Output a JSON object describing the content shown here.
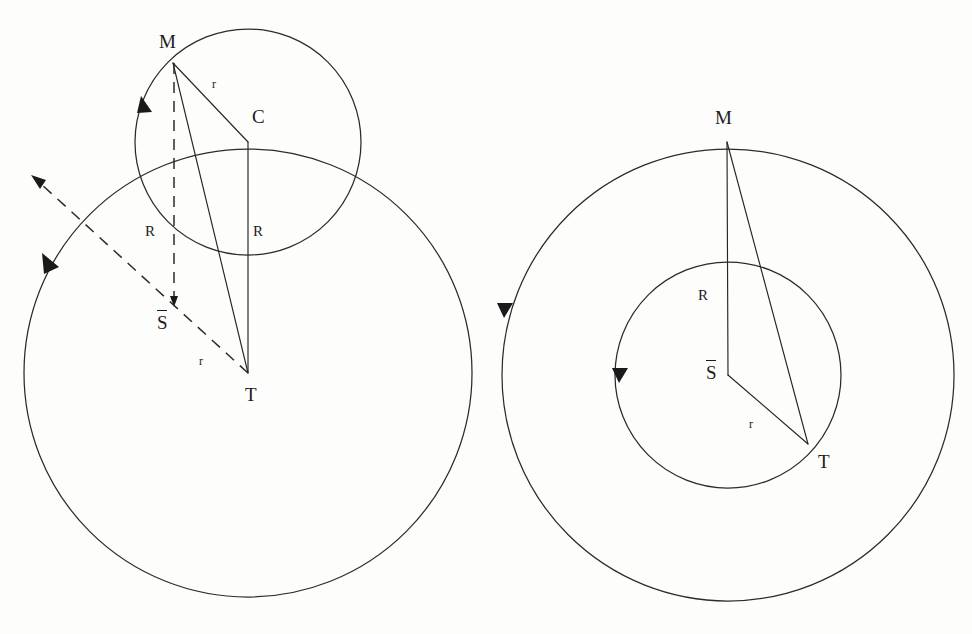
{
  "figure": {
    "background_color": "#fdfdfc",
    "ink_color": "#2b2b2b",
    "width": 972,
    "height": 634
  },
  "left_diagram": {
    "name": "epicycle-on-deferent",
    "points": {
      "M": {
        "label": "M",
        "x": 173,
        "y": 63
      },
      "C": {
        "label": "C",
        "x": 248,
        "y": 142
      },
      "T": {
        "label": "T",
        "x": 248,
        "y": 373
      },
      "S_bar": {
        "label": "S",
        "overbar": true,
        "x": 174,
        "y": 302
      }
    },
    "point_labels": [
      {
        "name": "label-M",
        "text": "M",
        "left": 159,
        "top": 32
      },
      {
        "name": "label-C",
        "text": "C",
        "left": 252,
        "top": 107
      },
      {
        "name": "label-T",
        "text": "T",
        "left": 245,
        "top": 385
      },
      {
        "name": "label-S-bar",
        "text": "S",
        "left": 157,
        "top": 313,
        "overbar": true
      }
    ],
    "segment_labels": [
      {
        "name": "label-r-MC",
        "text": "r",
        "left": 212,
        "top": 78
      },
      {
        "name": "label-R-left",
        "text": "R",
        "left": 145,
        "top": 224
      },
      {
        "name": "label-R-center",
        "text": "R",
        "left": 253,
        "top": 224
      },
      {
        "name": "label-r-diagonal",
        "text": "r",
        "left": 199,
        "top": 355
      }
    ],
    "circles": [
      {
        "name": "epicycle-small-circle",
        "cx": 248,
        "cy": 142,
        "r": 113
      },
      {
        "name": "deferent-large-circle",
        "cx": 248,
        "cy": 373,
        "r": 224
      }
    ],
    "solid_segments": [
      {
        "name": "segment-M-to-C",
        "label": "r"
      },
      {
        "name": "segment-M-to-T",
        "label": ""
      },
      {
        "name": "segment-C-to-T",
        "label": "R"
      }
    ],
    "dashed_segments": [
      {
        "name": "dashed-vertical-M-to-Sbar",
        "label": "R"
      },
      {
        "name": "dashed-arrow-T-to-upper-left",
        "label": "r"
      }
    ],
    "arrows": [
      {
        "name": "arrow-epicycle-direction",
        "on": "epicycle-small-circle",
        "direction": "counterclockwise"
      },
      {
        "name": "arrow-deferent-direction",
        "on": "deferent-large-circle",
        "direction": "counterclockwise"
      },
      {
        "name": "arrow-dashed-radius-vector",
        "on": "dashed-arrow-T-to-upper-left",
        "direction": "outward"
      }
    ]
  },
  "right_diagram": {
    "name": "concentric-circles-construction",
    "points": {
      "M": {
        "label": "M",
        "x": 727,
        "y": 142
      },
      "T": {
        "label": "T",
        "x": 808,
        "y": 444
      },
      "S_bar": {
        "label": "S",
        "overbar": true,
        "x": 728,
        "y": 375
      }
    },
    "point_labels": [
      {
        "name": "label-M",
        "text": "M",
        "left": 715,
        "top": 108
      },
      {
        "name": "label-T",
        "text": "T",
        "left": 818,
        "top": 452
      },
      {
        "name": "label-S-bar",
        "text": "S",
        "left": 706,
        "top": 363,
        "overbar": true
      }
    ],
    "segment_labels": [
      {
        "name": "label-R",
        "text": "R",
        "left": 698,
        "top": 288
      },
      {
        "name": "label-r",
        "text": "r",
        "left": 749,
        "top": 418
      }
    ],
    "circles": [
      {
        "name": "outer-circle",
        "cx": 728,
        "cy": 375,
        "r": 226
      },
      {
        "name": "inner-circle",
        "cx": 728,
        "cy": 375,
        "r": 113
      }
    ],
    "solid_segments": [
      {
        "name": "segment-Sbar-to-M",
        "label": "R"
      },
      {
        "name": "segment-Sbar-to-T",
        "label": "r"
      },
      {
        "name": "segment-M-to-T",
        "label": ""
      }
    ],
    "arrows": [
      {
        "name": "arrow-outer-circle-direction",
        "on": "outer-circle",
        "direction": "counterclockwise"
      },
      {
        "name": "arrow-inner-circle-direction",
        "on": "inner-circle",
        "direction": "counterclockwise"
      }
    ]
  },
  "caption": {
    "text": ""
  }
}
